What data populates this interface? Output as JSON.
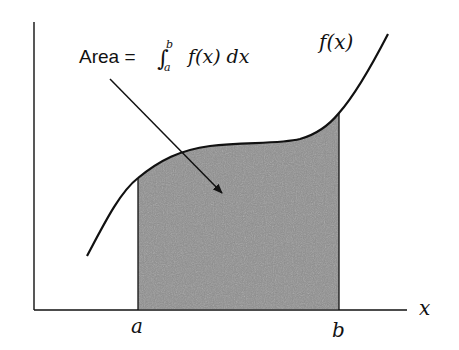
{
  "diagram": {
    "annotation": {
      "prefix": "Area = ",
      "integral_symbol": "∫",
      "lower_limit": "a",
      "upper_limit": "b",
      "integrand": "f(x) dx"
    },
    "curve_label": "f(x)",
    "x_axis_label": "x",
    "lower_bound_label": "a",
    "upper_bound_label": "b",
    "colors": {
      "stroke": "#111111",
      "shaded_area": "#8f8f8f",
      "background": "#ffffff"
    }
  }
}
